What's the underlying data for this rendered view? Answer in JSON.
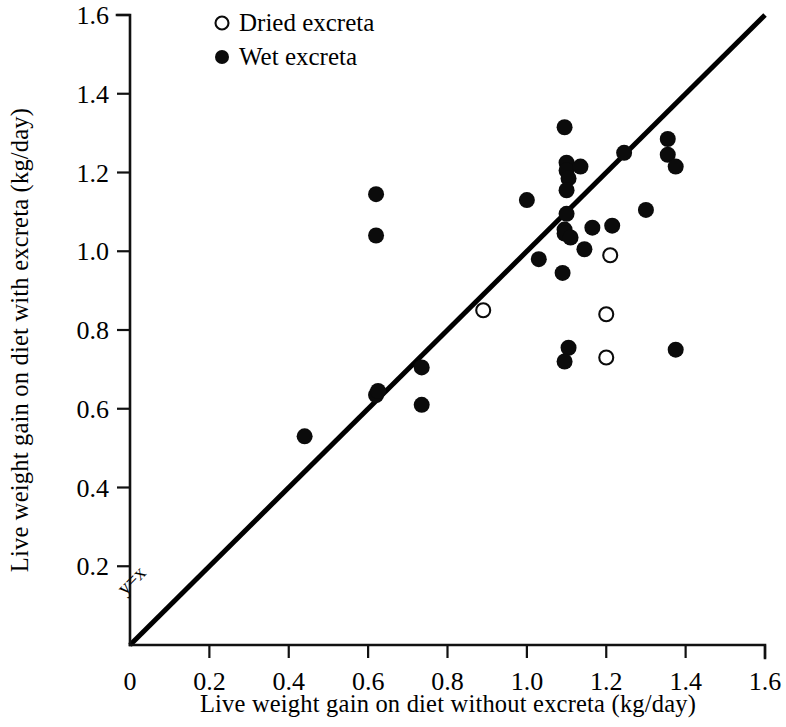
{
  "chart_data": {
    "type": "scatter",
    "title": "",
    "xlabel": "Live weight gain on diet without excreta (kg/day)",
    "ylabel": "Live weight gain on diet with excreta (kg/day)",
    "xlim": [
      0,
      1.6
    ],
    "ylim": [
      0,
      1.6
    ],
    "xticks": [
      "0",
      "0.2",
      "0.4",
      "0.6",
      "0.8",
      "1.0",
      "1.2",
      "1.4",
      "1.6"
    ],
    "xtick_values": [
      0,
      0.2,
      0.4,
      0.6,
      0.8,
      1.0,
      1.2,
      1.4,
      1.6
    ],
    "yticks": [
      "0.2",
      "0.4",
      "0.6",
      "0.8",
      "1.0",
      "1.2",
      "1.4",
      "1.6"
    ],
    "ytick_values": [
      0.2,
      0.4,
      0.6,
      0.8,
      1.0,
      1.2,
      1.4,
      1.6
    ],
    "grid": false,
    "legend_position": "top-center",
    "reference_line": {
      "label": "y=x",
      "equation": "y = x",
      "from": [
        0,
        0
      ],
      "to": [
        1.6,
        1.6
      ]
    },
    "series": [
      {
        "name": "Dried excreta",
        "marker": "open-circle",
        "color": "#ffffff",
        "edge_color": "#0b0b0b",
        "points": [
          [
            0.89,
            0.85
          ],
          [
            1.21,
            0.99
          ],
          [
            1.2,
            0.84
          ],
          [
            1.2,
            0.73
          ]
        ]
      },
      {
        "name": "Wet excreta",
        "marker": "filled-circle",
        "color": "#0b0b0b",
        "points": [
          [
            0.44,
            0.53
          ],
          [
            0.62,
            1.145
          ],
          [
            0.62,
            1.04
          ],
          [
            0.62,
            0.635
          ],
          [
            0.625,
            0.645
          ],
          [
            0.735,
            0.705
          ],
          [
            0.735,
            0.61
          ],
          [
            1.0,
            1.13
          ],
          [
            1.03,
            0.98
          ],
          [
            1.095,
            1.315
          ],
          [
            1.1,
            1.225
          ],
          [
            1.1,
            1.205
          ],
          [
            1.105,
            1.185
          ],
          [
            1.1,
            1.155
          ],
          [
            1.135,
            1.215
          ],
          [
            1.1,
            1.095
          ],
          [
            1.095,
            1.055
          ],
          [
            1.095,
            1.045
          ],
          [
            1.11,
            1.035
          ],
          [
            1.09,
            0.945
          ],
          [
            1.105,
            0.755
          ],
          [
            1.095,
            0.72
          ],
          [
            1.165,
            1.06
          ],
          [
            1.145,
            1.005
          ],
          [
            1.215,
            1.065
          ],
          [
            1.245,
            1.25
          ],
          [
            1.3,
            1.105
          ],
          [
            1.355,
            1.285
          ],
          [
            1.355,
            1.245
          ],
          [
            1.375,
            1.215
          ],
          [
            1.375,
            0.75
          ]
        ]
      }
    ]
  },
  "legend": {
    "items": [
      {
        "label": "Dried excreta",
        "marker": "open-circle"
      },
      {
        "label": "Wet excreta",
        "marker": "filled-circle"
      }
    ]
  },
  "axes": {
    "x_title": "Live weight gain on diet without excreta (kg/day)",
    "y_title": "Live weight gain on diet with excreta (kg/day)",
    "x_tick_labels": [
      "0",
      "0.2",
      "0.4",
      "0.6",
      "0.8",
      "1.0",
      "1.2",
      "1.4",
      "1.6"
    ],
    "y_tick_labels": [
      "0.2",
      "0.4",
      "0.6",
      "0.8",
      "1.0",
      "1.2",
      "1.4",
      "1.6"
    ]
  },
  "annotations": {
    "identity_line_label": "y=x"
  },
  "colors": {
    "ink": "#0b0b0b",
    "background": "#ffffff"
  }
}
